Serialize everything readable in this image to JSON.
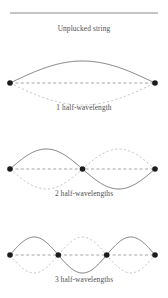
{
  "figure": {
    "background_color": "#ffffff",
    "text_color": "#4f4f4f",
    "solid_curve_color": "#6b6b6b",
    "dashed_curve_color": "#b4b4b4",
    "axis_color": "#909090",
    "node_color": "#1c1c1c",
    "string_color": "#8a8a8a"
  },
  "unplucked": {
    "label": "Unplucked string",
    "line": {
      "x1": 10,
      "y1": 13,
      "x2": 158,
      "y2": 13
    }
  },
  "modes": [
    {
      "id": "mode-1",
      "caption": "1 half-wavelength",
      "half_wavelengths": 1,
      "harmonic": 1,
      "amplitude": 22,
      "baseline_y": 83,
      "caption_y": 110,
      "x_start": 10,
      "x_end": 155,
      "nodes": [
        {
          "x": 10,
          "y": 83
        },
        {
          "x": 155,
          "y": 83
        }
      ],
      "node_count": 2,
      "antinode_count": 1
    },
    {
      "id": "mode-2",
      "caption": "2 half-wavelengths",
      "half_wavelengths": 2,
      "harmonic": 2,
      "amplitude": 20,
      "baseline_y": 169,
      "caption_y": 196,
      "x_start": 10,
      "x_end": 155,
      "nodes": [
        {
          "x": 10,
          "y": 169
        },
        {
          "x": 82.5,
          "y": 169
        },
        {
          "x": 155,
          "y": 169
        }
      ],
      "node_count": 3,
      "antinode_count": 2
    },
    {
      "id": "mode-3",
      "caption": "3 half-wavelengths",
      "half_wavelengths": 3,
      "harmonic": 3,
      "amplitude": 18,
      "baseline_y": 255,
      "caption_y": 282,
      "x_start": 10,
      "x_end": 155,
      "nodes": [
        {
          "x": 10,
          "y": 255
        },
        {
          "x": 58.3,
          "y": 255
        },
        {
          "x": 106.7,
          "y": 255
        },
        {
          "x": 155,
          "y": 255
        }
      ],
      "node_count": 4,
      "antinode_count": 3
    }
  ],
  "chart_data": {
    "type": "line",
    "xlabel": "",
    "ylabel": "",
    "series": [
      {
        "name": "Unplucked string",
        "half_wavelengths": 0,
        "amplitude": 0
      },
      {
        "name": "1 half-wavelength",
        "half_wavelengths": 1,
        "amplitude": 22
      },
      {
        "name": "2 half-wavelengths",
        "half_wavelengths": 2,
        "amplitude": 20
      },
      {
        "name": "3 half-wavelengths",
        "half_wavelengths": 3,
        "amplitude": 18
      }
    ]
  }
}
